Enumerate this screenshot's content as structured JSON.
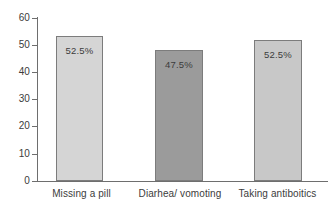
{
  "chart_data": {
    "type": "bar",
    "title": "",
    "subtitle": "",
    "xlabel": "",
    "ylabel": "",
    "ylim": [
      0,
      60
    ],
    "yticks": [
      0,
      10,
      20,
      30,
      40,
      50,
      60
    ],
    "grid": false,
    "legend": "none",
    "categories": [
      "Missing a pill",
      "Diarhea/ vomoting",
      "Taking antiboitics"
    ],
    "values": [
      53.4,
      48.2,
      51.9
    ],
    "data_labels": [
      "52.5%",
      "47.5%",
      "52.5%"
    ],
    "bar_colors": [
      "#d5d5d5",
      "#9b9b9b",
      "#c8c8c8"
    ],
    "bar_border_color": "#7c7c7c",
    "axis_color": "#6e6e6e",
    "text_color": "#3c3c3c",
    "background": "#ffffff"
  },
  "axis": {
    "y_tick_labels": [
      "60",
      "50",
      "40",
      "30",
      "20",
      "10",
      "0"
    ]
  }
}
